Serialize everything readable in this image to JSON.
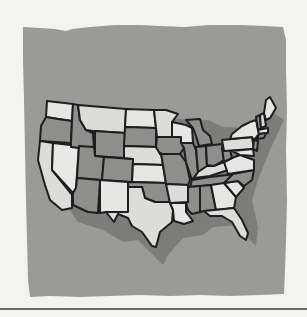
{
  "illustration": {
    "subject": "map of the contiguous United States",
    "style": "grayscale torn-paper illustration",
    "colors": {
      "page_background": "#f3f3f1",
      "backdrop": "#9a9a98",
      "shadow": "#7c7c7a",
      "state_light": "#dcdcda",
      "state_lighter": "#e8e8e6",
      "state_medium": "#8e8e8c",
      "outline": "#1e1e1e",
      "bottom_rule": "#6a6a6a"
    }
  }
}
